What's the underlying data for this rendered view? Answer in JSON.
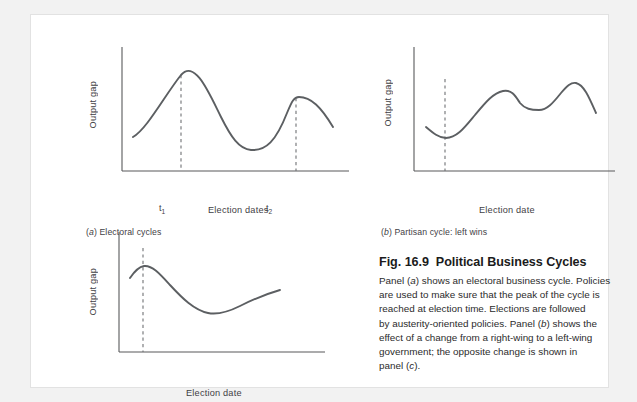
{
  "figure": {
    "heading_number": "Fig. 16.9",
    "heading_title": "Political Business Cycles",
    "body_lines": [
      "Panel (a) shows an electoral business cycle. Policies",
      "are used to make sure that the peak of the cycle is",
      "reached at election time. Elections are followed",
      "by austerity-oriented policies. Panel (b) shows the",
      "effect of a change from a right-wing to a left-wing",
      "government; the opposite change is shown in",
      "panel (c)."
    ],
    "body_text": "Panel (a) shows an electoral business cycle. Policies are used to make sure that the peak of the cycle is reached at election time. Elections are followed by austerity-oriented policies. Panel (b) shows the effect of a change from a right-wing to a left-wing government; the opposite change is shown in panel (c)."
  },
  "colors": {
    "page_background": "#f2f2f2",
    "card_background": "#ffffff",
    "card_border": "#e2e2e2",
    "curve": "#5c5f62",
    "axis": "#58595b",
    "dashed_marker": "#6f7174",
    "text": "#2b2b2b"
  },
  "chart_data": [
    {
      "type": "line",
      "panel_id": "a",
      "panel_label": "(a) Electoral cycles",
      "panel_letter": "a",
      "panel_title": "Electoral cycles",
      "title": "Electoral cycles",
      "xlabel": "Election dates",
      "ylabel": "Output gap",
      "grid": false,
      "legend": "none",
      "xlim": [
        0,
        100
      ],
      "ylim": [
        0,
        100
      ],
      "tick_labels": [
        "t1",
        "t2"
      ],
      "tick_label_display": [
        "t₁",
        "t₂"
      ],
      "tick_positions": [
        26,
        76
      ],
      "annotations": [
        {
          "label": "t1",
          "x": 26,
          "type": "vertical-dashed-line",
          "note": "election date 1 at cycle peak"
        },
        {
          "label": "t2",
          "x": 76,
          "type": "vertical-dashed-line",
          "note": "election date 2 at cycle peak"
        }
      ],
      "x": [
        5,
        14,
        26,
        38,
        50,
        58,
        64,
        70,
        76,
        84,
        92,
        100
      ],
      "y": [
        38,
        60,
        86,
        60,
        33,
        26,
        27,
        42,
        72,
        75,
        64,
        50
      ],
      "series": [
        {
          "name": "Output gap",
          "x": [
            5,
            14,
            26,
            38,
            50,
            58,
            64,
            70,
            76,
            84,
            92,
            100
          ],
          "values": [
            38,
            60,
            86,
            60,
            33,
            26,
            27,
            42,
            72,
            75,
            64,
            50
          ]
        }
      ]
    },
    {
      "type": "line",
      "panel_id": "b",
      "panel_label": "(b) Partisan cycle: left wins",
      "panel_letter": "b",
      "panel_title": "Partisan cycle: left wins",
      "title": "Partisan cycle: left wins",
      "xlabel": "Election date",
      "ylabel": "Output gap",
      "grid": false,
      "legend": "none",
      "xlim": [
        0,
        100
      ],
      "ylim": [
        0,
        100
      ],
      "annotations": [
        {
          "label": "election date",
          "x": 16,
          "type": "vertical-dashed-line",
          "note": "left-wing government takes office at cycle trough"
        }
      ],
      "x": [
        4,
        10,
        16,
        26,
        38,
        48,
        56,
        64,
        72,
        80,
        88,
        96
      ],
      "y": [
        34,
        27,
        25,
        38,
        54,
        64,
        58,
        56,
        62,
        73,
        66,
        46
      ],
      "series": [
        {
          "name": "Output gap",
          "x": [
            4,
            10,
            16,
            26,
            38,
            48,
            56,
            64,
            72,
            80,
            88,
            96
          ],
          "values": [
            34,
            27,
            25,
            38,
            54,
            64,
            58,
            56,
            62,
            73,
            66,
            46
          ]
        }
      ]
    },
    {
      "type": "line",
      "panel_id": "c",
      "panel_label": "(c) Partisan cycle: right wins",
      "panel_letter": "c",
      "panel_title": "Partisan cycle: right wins",
      "title": "Partisan cycle: right wins",
      "xlabel": "Election date",
      "ylabel": "Output gap",
      "grid": false,
      "legend": "none",
      "xlim": [
        0,
        100
      ],
      "ylim": [
        0,
        100
      ],
      "annotations": [
        {
          "label": "election date",
          "x": 14,
          "type": "vertical-dashed-line",
          "note": "right-wing government takes office at cycle peak"
        }
      ],
      "x": [
        4,
        9,
        14,
        26,
        40,
        52,
        62,
        72,
        82,
        92
      ],
      "y": [
        62,
        68,
        70,
        63,
        51,
        41,
        37,
        38,
        43,
        48
      ],
      "series": [
        {
          "name": "Output gap",
          "x": [
            4,
            9,
            14,
            26,
            40,
            52,
            62,
            72,
            82,
            92
          ],
          "values": [
            62,
            68,
            70,
            63,
            51,
            41,
            37,
            38,
            43,
            48
          ]
        }
      ]
    }
  ]
}
